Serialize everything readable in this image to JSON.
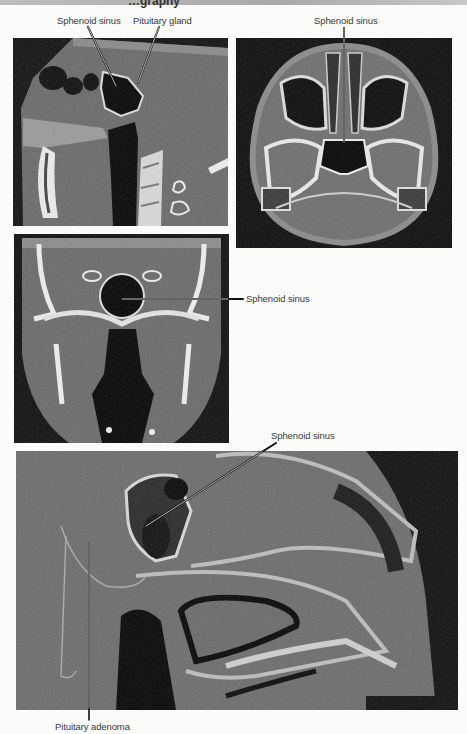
{
  "header": {
    "title": "…graphy"
  },
  "figures": [
    {
      "id": "sagittal-ct",
      "view": "sagittal",
      "labels": [
        {
          "text": "Sphenoid sinus"
        },
        {
          "text": "Pituitary gland"
        }
      ]
    },
    {
      "id": "axial-ct",
      "view": "axial",
      "labels": [
        {
          "text": "Sphenoid sinus"
        }
      ]
    },
    {
      "id": "coronal-ct",
      "view": "coronal",
      "labels": [
        {
          "text": "Sphenoid sinus"
        }
      ]
    },
    {
      "id": "sagittal-ct-zoom",
      "view": "sagittal (magnified)",
      "labels": [
        {
          "text": "Sphenoid sinus"
        },
        {
          "text": "Pituitary adenoma"
        }
      ]
    }
  ],
  "colors": {
    "page_background": "#fbfbf9",
    "label_text": "#3a3a3a",
    "ct_background": "#111111",
    "soft_tissue": "#6b6b6b",
    "bone": "#e8e8e8",
    "air": "#0a0a0a"
  }
}
